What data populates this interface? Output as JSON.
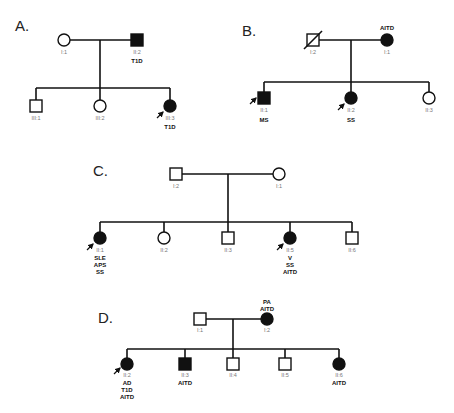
{
  "figure": {
    "panels": [
      {
        "label": "A.",
        "generation1": [
          {
            "id": "I:1",
            "sex": "female",
            "affected": false,
            "diagnoses": []
          },
          {
            "id": "II:2",
            "sex": "male",
            "affected": true,
            "diagnoses": [
              "T1D"
            ]
          }
        ],
        "generation2": [
          {
            "id": "III:1",
            "sex": "male",
            "affected": false,
            "proband": false,
            "diagnoses": []
          },
          {
            "id": "III:2",
            "sex": "female",
            "affected": false,
            "proband": false,
            "diagnoses": []
          },
          {
            "id": "III:3",
            "sex": "female",
            "affected": true,
            "proband": true,
            "diagnoses": [
              "T1D"
            ]
          }
        ]
      },
      {
        "label": "B.",
        "generation1": [
          {
            "id": "I:2",
            "sex": "male",
            "affected": false,
            "deceased": true,
            "diagnoses": []
          },
          {
            "id": "I:1",
            "sex": "female",
            "affected": true,
            "diagnoses": [
              "AITD"
            ]
          }
        ],
        "generation2": [
          {
            "id": "II:1",
            "sex": "male",
            "affected": true,
            "proband": true,
            "diagnoses": [
              "MS"
            ]
          },
          {
            "id": "II:2",
            "sex": "female",
            "affected": true,
            "proband": true,
            "diagnoses": [
              "SS"
            ]
          },
          {
            "id": "II:3",
            "sex": "female",
            "affected": false,
            "proband": false,
            "diagnoses": []
          }
        ]
      },
      {
        "label": "C.",
        "generation1": [
          {
            "id": "I:2",
            "sex": "male",
            "affected": false,
            "diagnoses": []
          },
          {
            "id": "I:1",
            "sex": "female",
            "affected": false,
            "diagnoses": []
          }
        ],
        "generation2": [
          {
            "id": "II:1",
            "sex": "female",
            "affected": true,
            "proband": true,
            "diagnoses": [
              "SLE",
              "APS",
              "SS"
            ]
          },
          {
            "id": "II:2",
            "sex": "female",
            "affected": false,
            "proband": false,
            "diagnoses": []
          },
          {
            "id": "II:3",
            "sex": "male",
            "affected": false,
            "proband": false,
            "diagnoses": []
          },
          {
            "id": "II:5",
            "sex": "female",
            "affected": true,
            "proband": true,
            "diagnoses": [
              "V",
              "SS",
              "AITD"
            ]
          },
          {
            "id": "II:6",
            "sex": "male",
            "affected": false,
            "proband": false,
            "diagnoses": []
          }
        ]
      },
      {
        "label": "D.",
        "generation1": [
          {
            "id": "I:1",
            "sex": "male",
            "affected": false,
            "diagnoses": []
          },
          {
            "id": "I:2",
            "sex": "female",
            "affected": true,
            "diagnoses": [
              "PA",
              "AITD"
            ]
          }
        ],
        "generation2": [
          {
            "id": "II:2",
            "sex": "female",
            "affected": true,
            "proband": true,
            "diagnoses": [
              "AD",
              "T1D",
              "AITD"
            ]
          },
          {
            "id": "II:3",
            "sex": "male",
            "affected": true,
            "proband": false,
            "diagnoses": [
              "AITD"
            ]
          },
          {
            "id": "II:4",
            "sex": "male",
            "affected": false,
            "proband": false,
            "diagnoses": []
          },
          {
            "id": "II:5",
            "sex": "male",
            "affected": false,
            "proband": false,
            "diagnoses": []
          },
          {
            "id": "II:6",
            "sex": "female",
            "affected": true,
            "proband": false,
            "diagnoses": [
              "AITD"
            ]
          }
        ]
      }
    ]
  }
}
